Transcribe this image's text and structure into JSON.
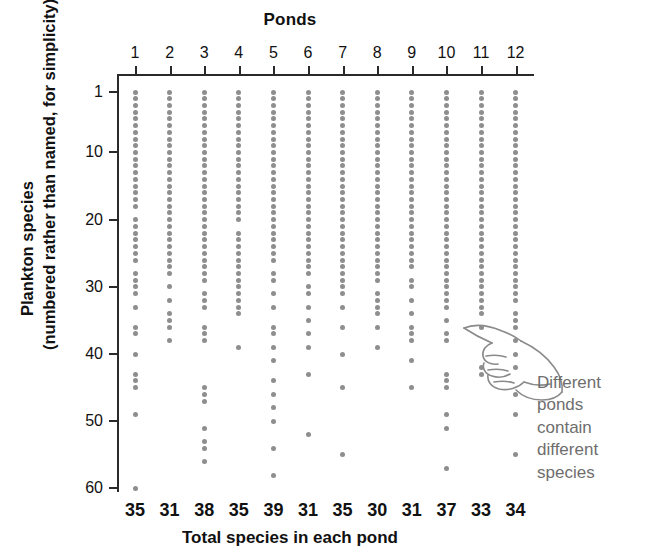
{
  "figure": {
    "cropped_top_text": "",
    "top_title": "Ponds",
    "x_caption": "Total species in each pond",
    "y_caption_line1": "Plankton species",
    "y_caption_line2": "(numbered rather than named, for simplicity)",
    "annotation": "Different ponds contain different species",
    "annotation_lines": [
      "Different",
      "ponds",
      "contain",
      "different",
      "species"
    ],
    "hand_icon": "pointing-hand-icon",
    "colors": {
      "dot": "#8e8e8e",
      "axis": "#2a2a2a",
      "text": "#111111",
      "annotation": "#6e6e6e",
      "background": "#ffffff"
    }
  },
  "chart_data": {
    "type": "scatter",
    "title": "Ponds",
    "xlabel": "Total species in each pond",
    "ylabel": "Plankton species (numbered rather than named, for simplicity)",
    "grid": false,
    "legend": null,
    "x_axis_position": "top",
    "y_axis_inverted": true,
    "ylim": [
      1,
      62
    ],
    "y_ticks": [
      1,
      10,
      20,
      30,
      40,
      50,
      60
    ],
    "y_tick_labels": [
      "1",
      "10",
      "20",
      "30",
      "40",
      "50",
      "60"
    ],
    "categories": [
      "1",
      "2",
      "3",
      "4",
      "5",
      "6",
      "7",
      "8",
      "9",
      "10",
      "11",
      "12"
    ],
    "category_axis_label": "Ponds",
    "totals_label": "Total species in each pond",
    "totals": [
      35,
      31,
      38,
      35,
      39,
      31,
      35,
      30,
      31,
      37,
      33,
      34
    ],
    "series": [
      {
        "name": "Pond 1",
        "total": 35,
        "species_present": [
          1,
          2,
          3,
          4,
          5,
          6,
          7,
          8,
          9,
          10,
          11,
          12,
          13,
          14,
          15,
          16,
          17,
          18,
          20,
          21,
          22,
          23,
          24,
          25,
          26,
          28,
          29,
          30,
          31,
          33,
          36,
          37,
          40,
          43,
          44,
          45,
          49,
          60
        ]
      },
      {
        "name": "Pond 2",
        "total": 31,
        "species_present": [
          1,
          2,
          3,
          4,
          5,
          6,
          7,
          8,
          9,
          10,
          11,
          12,
          13,
          14,
          15,
          16,
          17,
          18,
          19,
          20,
          21,
          22,
          23,
          24,
          25,
          26,
          27,
          28,
          30,
          32,
          34,
          35,
          36,
          38
        ]
      },
      {
        "name": "Pond 3",
        "total": 38,
        "species_present": [
          1,
          2,
          3,
          4,
          5,
          6,
          7,
          8,
          9,
          10,
          11,
          12,
          13,
          14,
          15,
          16,
          17,
          18,
          19,
          20,
          21,
          22,
          23,
          24,
          25,
          26,
          27,
          28,
          29,
          31,
          32,
          33,
          36,
          37,
          38,
          45,
          46,
          47,
          51,
          53,
          54,
          56
        ]
      },
      {
        "name": "Pond 4",
        "total": 35,
        "species_present": [
          1,
          2,
          3,
          4,
          5,
          6,
          7,
          8,
          9,
          10,
          11,
          12,
          13,
          14,
          15,
          16,
          17,
          18,
          19,
          20,
          22,
          23,
          24,
          25,
          26,
          27,
          28,
          29,
          30,
          31,
          32,
          33,
          34,
          39
        ]
      },
      {
        "name": "Pond 5",
        "total": 39,
        "species_present": [
          1,
          2,
          3,
          4,
          5,
          6,
          7,
          8,
          9,
          10,
          11,
          12,
          13,
          14,
          15,
          16,
          17,
          18,
          19,
          20,
          21,
          22,
          23,
          24,
          25,
          26,
          28,
          29,
          31,
          33,
          36,
          37,
          39,
          41,
          44,
          46,
          48,
          50,
          54,
          58
        ]
      },
      {
        "name": "Pond 6",
        "total": 31,
        "species_present": [
          1,
          2,
          3,
          4,
          5,
          6,
          7,
          8,
          9,
          10,
          11,
          12,
          13,
          14,
          15,
          16,
          17,
          18,
          19,
          20,
          21,
          22,
          23,
          24,
          25,
          26,
          27,
          28,
          30,
          31,
          33,
          35,
          37,
          39,
          43,
          52
        ]
      },
      {
        "name": "Pond 7",
        "total": 35,
        "species_present": [
          1,
          2,
          3,
          4,
          5,
          6,
          7,
          8,
          9,
          10,
          11,
          12,
          13,
          14,
          15,
          16,
          17,
          18,
          19,
          20,
          21,
          22,
          23,
          24,
          25,
          26,
          27,
          28,
          29,
          30,
          31,
          33,
          36,
          40,
          45,
          55
        ]
      },
      {
        "name": "Pond 8",
        "total": 30,
        "species_present": [
          1,
          2,
          3,
          4,
          5,
          6,
          7,
          8,
          9,
          10,
          11,
          12,
          13,
          14,
          15,
          16,
          17,
          18,
          19,
          20,
          21,
          22,
          23,
          24,
          25,
          26,
          27,
          28,
          29,
          31,
          32,
          33,
          34,
          36,
          39
        ]
      },
      {
        "name": "Pond 9",
        "total": 31,
        "species_present": [
          1,
          2,
          3,
          4,
          5,
          6,
          7,
          8,
          9,
          10,
          11,
          12,
          13,
          14,
          15,
          16,
          17,
          18,
          19,
          20,
          21,
          22,
          23,
          24,
          25,
          26,
          27,
          29,
          30,
          32,
          34,
          36,
          37,
          38,
          41,
          45
        ]
      },
      {
        "name": "Pond 10",
        "total": 37,
        "species_present": [
          1,
          2,
          3,
          4,
          5,
          6,
          7,
          8,
          9,
          10,
          11,
          12,
          13,
          14,
          15,
          16,
          17,
          18,
          19,
          20,
          21,
          22,
          23,
          24,
          25,
          26,
          27,
          28,
          29,
          30,
          31,
          32,
          33,
          35,
          37,
          38,
          43,
          44,
          45,
          49,
          51,
          57
        ]
      },
      {
        "name": "Pond 11",
        "total": 33,
        "species_present": [
          1,
          2,
          3,
          4,
          5,
          6,
          7,
          8,
          9,
          10,
          11,
          12,
          13,
          14,
          15,
          16,
          17,
          18,
          19,
          20,
          21,
          22,
          23,
          24,
          25,
          26,
          27,
          28,
          29,
          30,
          31,
          32,
          33,
          34,
          36,
          42,
          43
        ]
      },
      {
        "name": "Pond 12",
        "total": 34,
        "species_present": [
          1,
          2,
          3,
          4,
          5,
          6,
          7,
          8,
          9,
          10,
          11,
          12,
          13,
          14,
          15,
          16,
          17,
          18,
          19,
          20,
          21,
          22,
          23,
          24,
          25,
          26,
          27,
          28,
          29,
          30,
          31,
          32,
          34,
          35,
          36,
          38,
          40,
          42,
          46,
          49,
          55
        ]
      }
    ]
  }
}
